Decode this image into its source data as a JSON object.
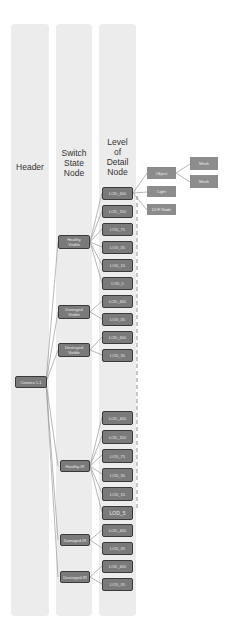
{
  "columns": [
    {
      "id": "header",
      "title": "Header"
    },
    {
      "id": "switch",
      "title": "Switch\nState\nNode"
    },
    {
      "id": "lod",
      "title": "Level\nof\nDetail\nNode"
    }
  ],
  "root": {
    "label": "Camera 1-1"
  },
  "switch_nodes": [
    {
      "label": "Healthy\nVisible"
    },
    {
      "label": "Damaged\nVisible"
    },
    {
      "label": "Destroyed\nVisible"
    },
    {
      "label": "Healthy-IR"
    },
    {
      "label": "Damaged-IR"
    },
    {
      "label": "Destroyed-IR"
    }
  ],
  "lod_nodes": [
    {
      "label": "LOD_400"
    },
    {
      "label": "LOD_150"
    },
    {
      "label": "LOD_75"
    },
    {
      "label": "LOD_35"
    },
    {
      "label": "LOD_15"
    },
    {
      "label": "LOD_5"
    },
    {
      "label": "LOD_400"
    },
    {
      "label": "LOD_35"
    },
    {
      "label": "LOD_400"
    },
    {
      "label": "LOD_35"
    },
    {
      "label": "LOD_400"
    },
    {
      "label": "LOD_150"
    },
    {
      "label": "LOD_75"
    },
    {
      "label": "LOD_35"
    },
    {
      "label": "LOD_15"
    },
    {
      "label": "LOD_5"
    },
    {
      "label": "LOD_400"
    },
    {
      "label": "LOD_35"
    },
    {
      "label": "LOD_400"
    },
    {
      "label": "LOD_35"
    }
  ],
  "detail_nodes": {
    "object": {
      "label": "Object"
    },
    "light": {
      "label": "Light"
    },
    "dof": {
      "label": "DOF Node"
    },
    "mesh1": {
      "label": "Mesh"
    },
    "mesh2": {
      "label": "Mesh"
    }
  },
  "colors": {
    "column_bg": "#ececec",
    "node_fill": "#7a7a7a",
    "node_border": "#3a3a3a",
    "leaf_fill": "#8c8c8c",
    "connector": "#9a9a9a"
  }
}
